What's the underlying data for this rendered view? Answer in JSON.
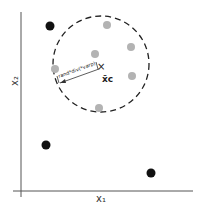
{
  "diagram": {
    "axes": {
      "x_label": "x₁",
      "y_label": "x₂",
      "color": "#555555"
    },
    "circle": {
      "cx": 101,
      "cy": 64,
      "r": 48,
      "stroke": "#222222",
      "dash": "6,4"
    },
    "center": {
      "x": 101,
      "y": 66,
      "marker": "×",
      "label": "x̄c"
    },
    "radius_annotation": {
      "text": "rand*div(*varp)",
      "x1": 60,
      "y1": 83,
      "x2": 99,
      "y2": 69
    },
    "inner_points": {
      "color": "#b3b3b3",
      "r": 4,
      "points": [
        [
          107,
          25
        ],
        [
          131,
          47
        ],
        [
          95,
          54
        ],
        [
          55,
          69
        ],
        [
          132,
          76
        ],
        [
          99,
          108
        ]
      ]
    },
    "outer_points": {
      "color": "#111111",
      "r": 4.5,
      "points": [
        [
          50,
          26
        ],
        [
          46,
          145
        ],
        [
          151,
          173
        ]
      ]
    }
  }
}
